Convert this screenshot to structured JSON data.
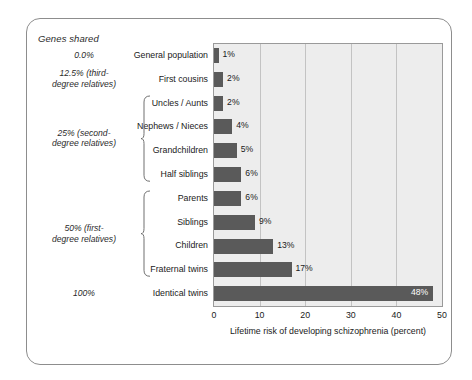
{
  "figure": {
    "genes_header": "Genes shared",
    "genes_groups": [
      {
        "text": "0.0%",
        "rows": [
          0
        ]
      },
      {
        "text": "12.5% (third-\ndegree relatives)",
        "rows": [
          1
        ]
      },
      {
        "text": "25% (second-\ndegree relatives)",
        "rows": [
          2,
          3,
          4,
          5
        ],
        "brace": true
      },
      {
        "text": "50% (first-\ndegree relatives)",
        "rows": [
          6,
          7,
          8,
          9
        ],
        "brace": true
      },
      {
        "text": "100%",
        "rows": [
          10
        ]
      }
    ]
  },
  "chart_data": {
    "type": "bar",
    "orientation": "horizontal",
    "title": "",
    "xlabel": "Lifetime risk of developing schizophrenia (percent)",
    "ylabel": "",
    "xlim": [
      0,
      50
    ],
    "xticks": [
      0,
      10,
      20,
      30,
      40,
      50
    ],
    "grid": "vertical",
    "legend": "none",
    "bar_color": "#5a5a5a",
    "plot_background": "#ededed",
    "categories": [
      "General population",
      "First cousins",
      "Uncles / Aunts",
      "Nephews / Nieces",
      "Grandchildren",
      "Half siblings",
      "Parents",
      "Siblings",
      "Children",
      "Fraternal twins",
      "Identical twins"
    ],
    "values": [
      1,
      2,
      2,
      4,
      5,
      6,
      6,
      9,
      13,
      17,
      48
    ],
    "data_labels": [
      "1%",
      "2%",
      "2%",
      "4%",
      "5%",
      "6%",
      "6%",
      "9%",
      "13%",
      "17%",
      "48%"
    ],
    "genes_shared": [
      "0.0%",
      "12.5% (third-degree relatives)",
      "12.5% (third-degree relatives)",
      "25% (second-degree relatives)",
      "25% (second-degree relatives)",
      "25% (second-degree relatives)",
      "50% (first-degree relatives)",
      "50% (first-degree relatives)",
      "50% (first-degree relatives)",
      "50% (first-degree relatives)",
      "100%"
    ]
  }
}
